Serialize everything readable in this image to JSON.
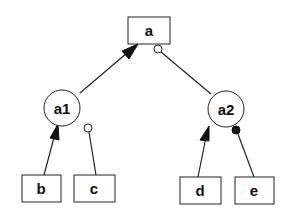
{
  "diagram": {
    "type": "tree",
    "colors": {
      "stroke": "#222222",
      "fill": "#ffffff",
      "text": "#111111"
    },
    "nodes": {
      "a": {
        "label": "a",
        "shape": "rectangle"
      },
      "a1": {
        "label": "a1",
        "shape": "circle"
      },
      "a2": {
        "label": "a2",
        "shape": "circle"
      },
      "b": {
        "label": "b",
        "shape": "rectangle"
      },
      "c": {
        "label": "c",
        "shape": "rectangle"
      },
      "d": {
        "label": "d",
        "shape": "rectangle"
      },
      "e": {
        "label": "e",
        "shape": "rectangle"
      }
    },
    "edges": [
      {
        "from": "a1",
        "to": "a",
        "end_marker": "filled-arrow"
      },
      {
        "from": "a2",
        "to": "a",
        "end_marker": "open-circle"
      },
      {
        "from": "b",
        "to": "a1",
        "end_marker": "filled-arrow"
      },
      {
        "from": "c",
        "to": "a1",
        "end_marker": "open-circle"
      },
      {
        "from": "d",
        "to": "a2",
        "end_marker": "filled-arrow"
      },
      {
        "from": "e",
        "to": "a2",
        "end_marker": "filled-circle"
      }
    ]
  }
}
